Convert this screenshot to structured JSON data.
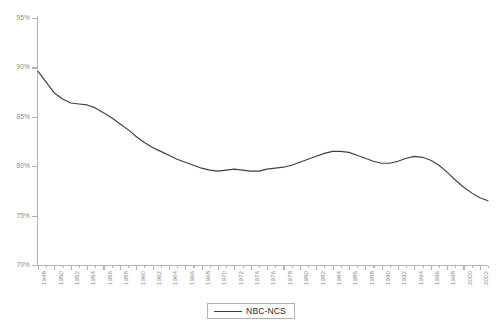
{
  "chart_data": {
    "type": "line",
    "title": "",
    "xlabel": "",
    "ylabel": "",
    "ylim": [
      70,
      95
    ],
    "xlim": [
      1948,
      2003
    ],
    "y_tick_labels": [
      "95%",
      "90%",
      "85%",
      "80%",
      "75%",
      "70%"
    ],
    "y_tick_values": [
      95,
      90,
      85,
      80,
      75,
      70
    ],
    "x_tick_labels": [
      "1948",
      "1950",
      "1952",
      "1954",
      "1956",
      "1958",
      "1960",
      "1962",
      "1964",
      "1966",
      "1968",
      "1970",
      "1972",
      "1974",
      "1976",
      "1978",
      "1980",
      "1982",
      "1984",
      "1986",
      "1988",
      "1990",
      "1992",
      "1994",
      "1996",
      "1998",
      "2000",
      "2002"
    ],
    "x_tick_values": [
      1948,
      1950,
      1952,
      1954,
      1956,
      1958,
      1960,
      1962,
      1964,
      1966,
      1968,
      1970,
      1972,
      1974,
      1976,
      1978,
      1980,
      1982,
      1984,
      1986,
      1988,
      1990,
      1992,
      1994,
      1996,
      1998,
      2000,
      2002
    ],
    "grid": false,
    "legend_position": "bottom-center",
    "line_color": "#3f3f3f",
    "axis_color": "#b4b4b4",
    "tick_label_color": "#8a8a8a",
    "series": [
      {
        "name": "NBC-NCS",
        "x": [
          1948,
          1949,
          1950,
          1951,
          1952,
          1953,
          1954,
          1955,
          1956,
          1957,
          1958,
          1959,
          1960,
          1961,
          1962,
          1963,
          1964,
          1965,
          1966,
          1967,
          1968,
          1969,
          1970,
          1971,
          1972,
          1973,
          1974,
          1975,
          1976,
          1977,
          1978,
          1979,
          1980,
          1981,
          1982,
          1983,
          1984,
          1985,
          1986,
          1987,
          1988,
          1989,
          1990,
          1991,
          1992,
          1993,
          1994,
          1995,
          1996,
          1997,
          1998,
          1999,
          2000,
          2001,
          2002,
          2003
        ],
        "values": [
          89.6,
          88.5,
          87.4,
          86.8,
          86.4,
          86.3,
          86.2,
          85.9,
          85.4,
          84.9,
          84.3,
          83.7,
          83.0,
          82.4,
          81.9,
          81.5,
          81.1,
          80.7,
          80.4,
          80.1,
          79.8,
          79.6,
          79.5,
          79.6,
          79.7,
          79.6,
          79.5,
          79.5,
          79.7,
          79.8,
          79.9,
          80.1,
          80.4,
          80.7,
          81.0,
          81.3,
          81.5,
          81.5,
          81.4,
          81.1,
          80.8,
          80.5,
          80.3,
          80.3,
          80.5,
          80.8,
          81.0,
          80.9,
          80.6,
          80.1,
          79.4,
          78.6,
          77.9,
          77.3,
          76.8,
          76.5
        ]
      }
    ]
  },
  "legend": {
    "label": "NBC-NCS"
  }
}
